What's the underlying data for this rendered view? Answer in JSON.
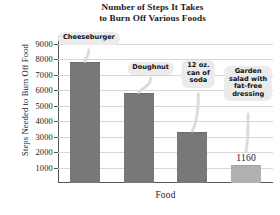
{
  "chart_data": {
    "type": "bar",
    "title": "Number of Steps It Takes to Burn Off Various Foods",
    "title_lines": [
      "Number of Steps It Takes",
      "to Burn Off Various Foods"
    ],
    "xlabel": "Food",
    "ylabel": "Steps Needed to Burn Off Food",
    "ylim": [
      0,
      9500
    ],
    "yticks": [
      1000,
      2000,
      3000,
      4000,
      5000,
      6000,
      7000,
      8000,
      9000
    ],
    "ytick_labels": [
      "1000",
      "2000",
      "3000",
      "4000",
      "5000",
      "6000",
      "7000",
      "8000",
      "9000"
    ],
    "grid": true,
    "legend": "none",
    "categories": [
      "Cheeseburger",
      "Doughnut",
      "12 oz. can of soda",
      "Garden salad with fat-free dressing"
    ],
    "values": [
      7800,
      5800,
      3300,
      1160
    ],
    "value_labels": [
      "",
      "",
      "",
      "1160"
    ],
    "bar_color": "#787878",
    "bar_color_last": "#b0b0b0",
    "annotations": [
      {
        "name": "cheeseburger",
        "lines": [
          "Cheeseburger"
        ]
      },
      {
        "name": "doughnut",
        "lines": [
          "Doughnut"
        ]
      },
      {
        "name": "soda",
        "lines": [
          "12 oz.",
          "can of",
          "soda"
        ]
      },
      {
        "name": "salad",
        "lines": [
          "Garden",
          "salad with",
          "fat-free",
          "dressing"
        ]
      }
    ]
  }
}
